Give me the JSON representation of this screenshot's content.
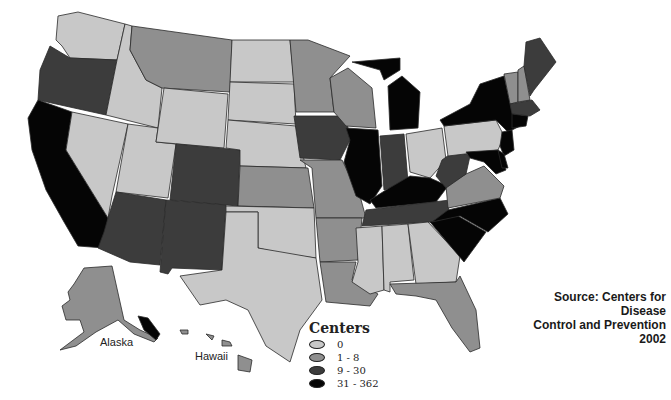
{
  "title": "Centers",
  "source": {
    "line1": "Source: Centers for Disease",
    "line2": "Control and Prevention 2002"
  },
  "labels": {
    "alaska": "Alaska",
    "hawaii": "Hawaii"
  },
  "legend": {
    "title": "Centers",
    "items": [
      {
        "label": "0",
        "color": "#c8c8c8"
      },
      {
        "label": "1 - 8",
        "color": "#8f8f8f"
      },
      {
        "label": "9 - 30",
        "color": "#3c3c3c"
      },
      {
        "label": "31 - 362",
        "color": "#050505"
      }
    ]
  },
  "colors": {
    "zero": "#c8c8c8",
    "low": "#8f8f8f",
    "mid": "#3c3c3c",
    "high": "#050505"
  },
  "states": {
    "WA": "0",
    "OR": "9 - 30",
    "CA": "31 - 362",
    "ID": "0",
    "NV": "0",
    "UT": "0",
    "AZ": "9 - 30",
    "MT": "1 - 8",
    "WY": "0",
    "CO": "9 - 30",
    "NM": "9 - 30",
    "ND": "0",
    "SD": "0",
    "NE": "0",
    "KS": "1 - 8",
    "OK": "0",
    "TX": "0",
    "MN": "1 - 8",
    "IA": "9 - 30",
    "MO": "1 - 8",
    "AR": "1 - 8",
    "LA": "1 - 8",
    "WI": "1 - 8",
    "IL": "31 - 362",
    "MI": "31 - 362",
    "IN": "9 - 30",
    "OH": "0",
    "KY": "31 - 362",
    "TN": "9 - 30",
    "MS": "0",
    "AL": "0",
    "GA": "0",
    "FL": "1 - 8",
    "SC": "31 - 362",
    "NC": "31 - 362",
    "VA": "1 - 8",
    "WV": "9 - 30",
    "PA": "0",
    "NY": "31 - 362",
    "VT": "1 - 8",
    "NH": "1 - 8",
    "ME": "9 - 30",
    "MA": "9 - 30",
    "CT": "31 - 362",
    "NJ": "31 - 362",
    "MD": "31 - 362",
    "DE": "31 - 362",
    "AK": "1 - 8",
    "HI": "1 - 8"
  }
}
